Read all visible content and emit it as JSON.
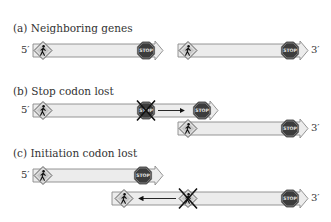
{
  "panels": {
    "a": {
      "label": "(a)  Neighboring genes"
    },
    "b": {
      "label": "(b)  Stop codon lost"
    },
    "c": {
      "label": "(c)  Initiation codon lost"
    }
  },
  "ends": {
    "five_prime": "5′",
    "three_prime": "3′"
  },
  "signs": {
    "stop_text": "STOP"
  },
  "colors": {
    "bar_fill": "#ececec",
    "bar_stroke": "#8a8a8a",
    "stop_fill": "#3c3c3c",
    "walk_fill": "#c8c8c8",
    "cross": "#111111",
    "text": "#333333"
  }
}
